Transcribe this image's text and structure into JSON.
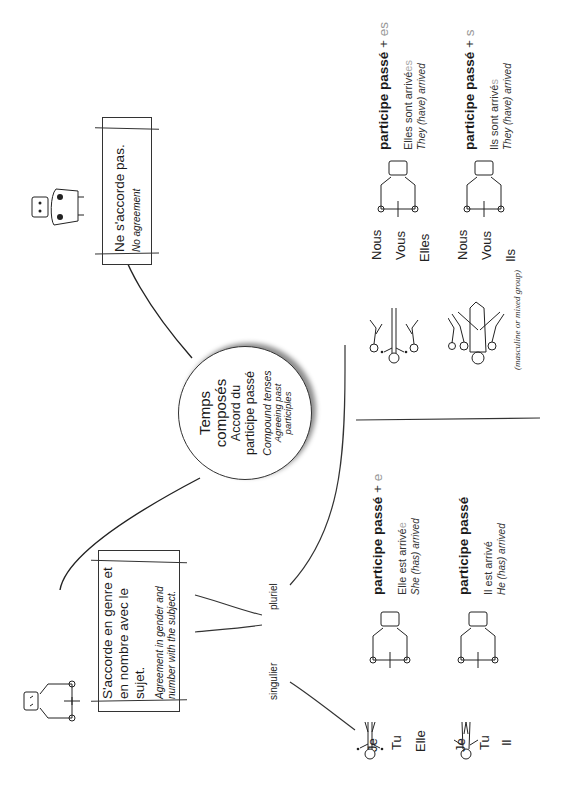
{
  "hub": {
    "title_line1": "Temps",
    "title_line2": "composés",
    "subtitle_line1": "Accord du",
    "subtitle_line2": "participe passé",
    "english_line1": "Compound tenses",
    "english_line2": "Agreeing past",
    "english_line3": "participles"
  },
  "no_agreement": {
    "french": "Ne s'accorde pas.",
    "english": "No agreement",
    "icon": "seated-figure-with-bag-icon"
  },
  "agreement": {
    "french_line1": "S'accorde en genre et",
    "french_line2": "en nombre avec le sujet.",
    "english_line1": "Agreement in gender and",
    "english_line2": "number with the subject.",
    "icon": "seated-figure-icon"
  },
  "branches": {
    "singular": "singulier",
    "plural": "pluriel"
  },
  "singular": {
    "feminine": {
      "pronouns": [
        "Je",
        "Tu",
        "Elle"
      ],
      "rule_bold": "participe passé",
      "rule_plus": "+",
      "rule_ending": "e",
      "example_base": "Elle est arrivé",
      "example_ending": "e",
      "translation": "She (has) arrived",
      "figure_icon": "woman-figure-icon"
    },
    "masculine": {
      "pronouns": [
        "Je",
        "Tu",
        "Il"
      ],
      "rule_bold": "participe passé",
      "example_base": "Il est arrivé",
      "translation": "He (has) arrived",
      "figure_icon": "man-figure-icon"
    }
  },
  "plural": {
    "feminine": {
      "pronouns": [
        "Nous",
        "Vous",
        "Elles"
      ],
      "rule_bold": "participe passé",
      "rule_plus": "+",
      "rule_ending": "es",
      "example_base": "Elles sont arrivé",
      "example_ending": "es",
      "translation": "They (have) arrived",
      "figure_icon": "group-of-women-icon"
    },
    "masculine": {
      "pronouns": [
        "Nous",
        "Vous",
        "Ils"
      ],
      "rule_bold": "participe passé",
      "rule_plus": "+",
      "rule_ending": "s",
      "example_base": "Ils sont arrivé",
      "example_ending": "s",
      "translation": "They (have) arrived",
      "note": "(masculine or mixed group)",
      "figure_icon": "mixed-group-icon"
    }
  },
  "colors": {
    "ink": "#1a1a1a",
    "ending_gray": "#999999",
    "background": "#ffffff"
  }
}
